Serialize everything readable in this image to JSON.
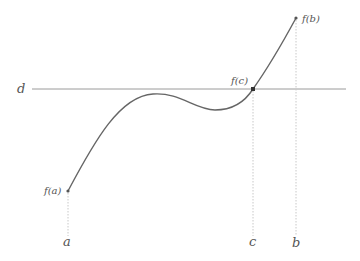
{
  "diagram": {
    "colors": {
      "curve": "#666666",
      "line_d": "#9a9a9a",
      "dotted": "#c8c8c8",
      "point": "#333333",
      "label": "#555555"
    },
    "labels": {
      "d": "d",
      "fa": "f(a)",
      "fb": "f(b)",
      "fc": "f(c)",
      "a": "a",
      "b": "b",
      "c": "c"
    }
  }
}
